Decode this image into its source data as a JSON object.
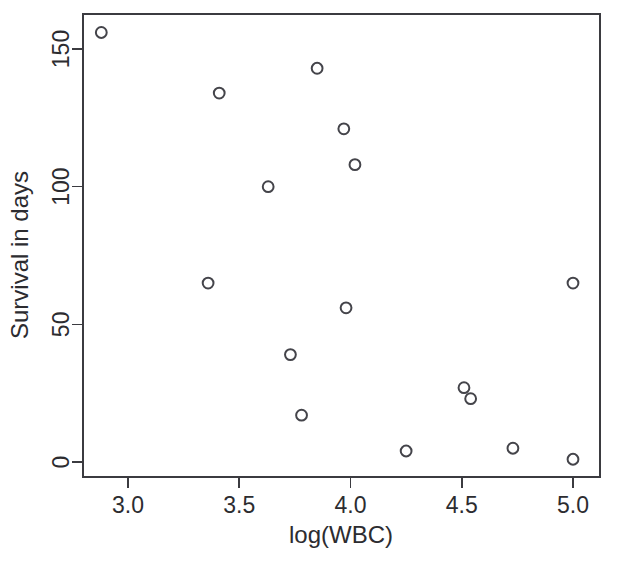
{
  "figure": {
    "background": "#ffffff",
    "foreground": "#2c2c30",
    "point_color": "#44444a",
    "point_symbol": "open-circle"
  },
  "chart_data": {
    "type": "scatter",
    "title": "",
    "xlabel": "log(WBC)",
    "ylabel": "Survival in days",
    "xlim": [
      2.8,
      5.09
    ],
    "ylim": [
      -4,
      161
    ],
    "xticks": [
      3.0,
      3.5,
      4.0,
      4.5,
      5.0
    ],
    "xtick_labels": [
      "3.0",
      "3.5",
      "4.0",
      "4.5",
      "5.0"
    ],
    "yticks": [
      0,
      50,
      100,
      150
    ],
    "ytick_labels": [
      "0",
      "50",
      "100",
      "150"
    ],
    "grid": false,
    "legend": null,
    "legend_position": "none",
    "n_points": 16,
    "x": [
      2.88,
      3.36,
      3.41,
      3.63,
      3.73,
      3.78,
      3.85,
      3.97,
      3.98,
      4.02,
      4.25,
      4.51,
      4.54,
      4.73,
      5.0,
      5.0
    ],
    "y": [
      156,
      65,
      134,
      100,
      39,
      17,
      143,
      121,
      56,
      108,
      4,
      27,
      23,
      5,
      65,
      1
    ],
    "points": [
      {
        "x": 2.88,
        "y": 156
      },
      {
        "x": 3.36,
        "y": 65
      },
      {
        "x": 3.41,
        "y": 134
      },
      {
        "x": 3.63,
        "y": 100
      },
      {
        "x": 3.73,
        "y": 39
      },
      {
        "x": 3.78,
        "y": 17
      },
      {
        "x": 3.85,
        "y": 143
      },
      {
        "x": 3.97,
        "y": 121
      },
      {
        "x": 3.98,
        "y": 56
      },
      {
        "x": 4.02,
        "y": 108
      },
      {
        "x": 4.25,
        "y": 4
      },
      {
        "x": 4.51,
        "y": 27
      },
      {
        "x": 4.54,
        "y": 23
      },
      {
        "x": 4.73,
        "y": 5
      },
      {
        "x": 5.0,
        "y": 65
      },
      {
        "x": 5.0,
        "y": 1
      }
    ]
  }
}
